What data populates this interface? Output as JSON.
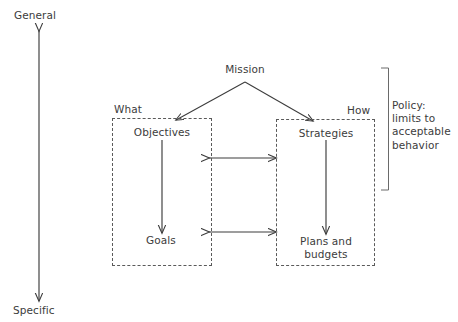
{
  "diagram": {
    "axis": {
      "top_label": "General",
      "bottom_label": "Specific"
    },
    "root": {
      "label": "Mission"
    },
    "columns": [
      {
        "caption": "What",
        "top_node": "Objectives",
        "bottom_node": "Goals"
      },
      {
        "caption": "How",
        "top_node": "Strategies",
        "bottom_node": "Plans and\nbudgets"
      }
    ],
    "annotation": {
      "text": "Policy:\nlimits to\nacceptable\nbehavior"
    },
    "colors": {
      "background": "#ffffff",
      "stroke": "#3c3c3c",
      "dashed_stroke": "#5a5a5a",
      "text": "#3c3c3c"
    }
  }
}
